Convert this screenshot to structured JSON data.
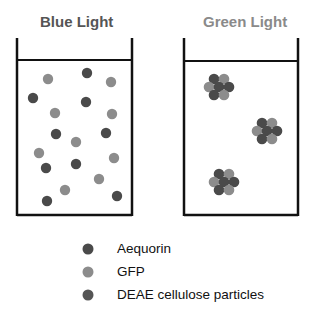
{
  "titles": {
    "left": "Blue Light",
    "right": "Green Light"
  },
  "colors": {
    "dark": "#4a4a4a",
    "gray": "#8c8c8c",
    "deae": "#555555",
    "stroke": "#111111",
    "title_left": "#555555",
    "title_right": "#8a8a8a"
  },
  "left_beaker": {
    "label": "Blue Light",
    "particles": [
      {
        "x": 48,
        "y": 79,
        "type": "gray"
      },
      {
        "x": 87,
        "y": 73,
        "type": "dark"
      },
      {
        "x": 111,
        "y": 82,
        "type": "gray"
      },
      {
        "x": 33,
        "y": 98,
        "type": "dark"
      },
      {
        "x": 86,
        "y": 102,
        "type": "dark"
      },
      {
        "x": 55,
        "y": 113,
        "type": "gray"
      },
      {
        "x": 112,
        "y": 114,
        "type": "gray"
      },
      {
        "x": 56,
        "y": 134,
        "type": "dark"
      },
      {
        "x": 106,
        "y": 133,
        "type": "dark"
      },
      {
        "x": 76,
        "y": 142,
        "type": "gray"
      },
      {
        "x": 39,
        "y": 153,
        "type": "gray"
      },
      {
        "x": 114,
        "y": 158,
        "type": "gray"
      },
      {
        "x": 46,
        "y": 168,
        "type": "dark"
      },
      {
        "x": 76,
        "y": 164,
        "type": "dark"
      },
      {
        "x": 99,
        "y": 179,
        "type": "gray"
      },
      {
        "x": 65,
        "y": 190,
        "type": "gray"
      },
      {
        "x": 47,
        "y": 201,
        "type": "dark"
      },
      {
        "x": 117,
        "y": 196,
        "type": "dark"
      }
    ]
  },
  "right_beaker": {
    "label": "Green Light",
    "clusters": [
      {
        "x": 219,
        "y": 87
      },
      {
        "x": 267,
        "y": 131
      },
      {
        "x": 224,
        "y": 182
      }
    ]
  },
  "legend": [
    {
      "label": "Aequorin",
      "color_key": "dark"
    },
    {
      "label": "GFP",
      "color_key": "gray"
    },
    {
      "label": "DEAE cellulose particles",
      "color_key": "deae"
    }
  ]
}
